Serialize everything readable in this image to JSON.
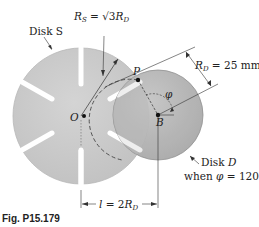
{
  "figure": {
    "caption": "Fig. P15.179",
    "labels": {
      "disk_s": "Disk S",
      "rs_eq": "R",
      "rs_sub": "S",
      "rs_rhs": " = √3",
      "rs_rhs_r": "R",
      "rs_rhs_sub": "D",
      "rd_r": "R",
      "rd_sub": "D",
      "rd_rhs": " = 25 mm",
      "point_p": "P",
      "point_o": "O",
      "point_b": "B",
      "angle": "φ",
      "disk_d_line1": "Disk ",
      "disk_d_line1_it": "D",
      "disk_d_line2": "when ",
      "disk_d_line2_phi": "φ",
      "disk_d_line2_rhs": " = 120°",
      "l_lhs": "l",
      "l_eq": " = 2",
      "l_r": "R",
      "l_sub": "D"
    },
    "geometry": {
      "disk_s": {
        "cx": 81,
        "cy": 116,
        "r": 68,
        "slots": 6,
        "fill": "#c8c8c8"
      },
      "disk_d": {
        "cx": 158,
        "cy": 115,
        "r": 45,
        "fill": "#b4b4b4"
      },
      "point_p": {
        "x": 138,
        "y": 80
      },
      "phi_deg": 120
    },
    "colors": {
      "disk_s": "#c9c9c9",
      "disk_d": "#b2b2b2",
      "line": "#333333",
      "background": "#ffffff"
    }
  }
}
